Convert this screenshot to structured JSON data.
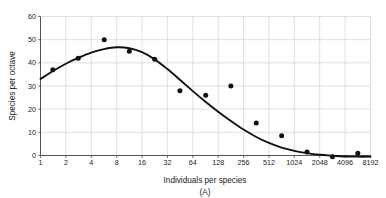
{
  "chart_data": {
    "type": "scatter",
    "title": "",
    "caption": "(A)",
    "xlabel": "Individuals per species",
    "ylabel": "Species per octave",
    "xscale": "log2",
    "xlim": [
      1,
      8192
    ],
    "ylim": [
      0,
      60
    ],
    "grid": true,
    "legend": null,
    "xtick_labels": [
      "1",
      "2",
      "4",
      "8",
      "16",
      "32",
      "64",
      "128",
      "256",
      "512",
      "1024",
      "2048",
      "4096",
      "8192"
    ],
    "xtick_values": [
      1,
      2,
      4,
      8,
      16,
      32,
      64,
      128,
      256,
      512,
      1024,
      2048,
      4096,
      8192
    ],
    "ytick_labels": [
      "0",
      "10",
      "20",
      "30",
      "40",
      "50",
      "60"
    ],
    "ytick_values": [
      0,
      10,
      20,
      30,
      40,
      50,
      60
    ],
    "points": [
      {
        "x": 1.4,
        "y": 37
      },
      {
        "x": 2.8,
        "y": 42
      },
      {
        "x": 5.7,
        "y": 50
      },
      {
        "x": 11.3,
        "y": 45
      },
      {
        "x": 22.6,
        "y": 41.5
      },
      {
        "x": 45,
        "y": 28
      },
      {
        "x": 91,
        "y": 26
      },
      {
        "x": 181,
        "y": 30
      },
      {
        "x": 362,
        "y": 14
      },
      {
        "x": 724,
        "y": 8.5
      },
      {
        "x": 1448,
        "y": 1.5
      },
      {
        "x": 2896,
        "y": -0.5
      },
      {
        "x": 5793,
        "y": 1
      }
    ],
    "curve": [
      {
        "x": 1,
        "y": 33
      },
      {
        "x": 1.41,
        "y": 36.5
      },
      {
        "x": 2,
        "y": 39.6
      },
      {
        "x": 2.83,
        "y": 42.2
      },
      {
        "x": 4,
        "y": 44.4
      },
      {
        "x": 5.66,
        "y": 45.9
      },
      {
        "x": 8,
        "y": 46.7
      },
      {
        "x": 11.3,
        "y": 46.3
      },
      {
        "x": 16,
        "y": 44.6
      },
      {
        "x": 22.6,
        "y": 41.5
      },
      {
        "x": 32,
        "y": 37.3
      },
      {
        "x": 45.3,
        "y": 32.6
      },
      {
        "x": 64,
        "y": 27.8
      },
      {
        "x": 90.5,
        "y": 23.2
      },
      {
        "x": 128,
        "y": 18.9
      },
      {
        "x": 181,
        "y": 14.9
      },
      {
        "x": 256,
        "y": 11.2
      },
      {
        "x": 362,
        "y": 8.0
      },
      {
        "x": 512,
        "y": 5.4
      },
      {
        "x": 724,
        "y": 3.4
      },
      {
        "x": 1024,
        "y": 2.0
      },
      {
        "x": 1448,
        "y": 1.0
      },
      {
        "x": 2048,
        "y": 0.3
      },
      {
        "x": 2896,
        "y": -0.1
      },
      {
        "x": 4096,
        "y": -0.4
      },
      {
        "x": 5793,
        "y": -0.5
      },
      {
        "x": 8192,
        "y": -0.5
      }
    ]
  },
  "style": {
    "point_color": "#111111",
    "curve_color": "#111111",
    "grid_color": "#d2d2d2",
    "axis_color": "#555555",
    "background": "#ffffff"
  }
}
